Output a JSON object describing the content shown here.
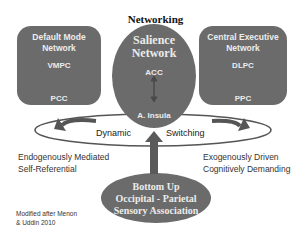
{
  "diagram": {
    "title": "Networking",
    "default_mode_network": {
      "title_line1": "Default Mode",
      "title_line2": "Network",
      "nodes": [
        "VMPC",
        "PCC"
      ]
    },
    "salience_network": {
      "title_line1": "Salience",
      "title_line2": "Network",
      "nodes": [
        "ACC",
        "A. Insula"
      ]
    },
    "central_executive_network": {
      "title_line1": "Central Executive",
      "title_line2": "Network",
      "nodes": [
        "DLPC",
        "PPC"
      ]
    },
    "switching_ring": {
      "left_label": "Dynamic",
      "right_label": "Switching"
    },
    "left_caption": {
      "line1": "Endogenously Mediated",
      "line2": "Self-Referential"
    },
    "right_caption": {
      "line1": "Exogenously Driven",
      "line2": "Cognitively Demanding"
    },
    "bottom_up": {
      "line1": "Bottom Up",
      "line2": "Occipital - Parietal",
      "line3": "Sensory Association"
    },
    "citation": {
      "line1": "Modified after Menon",
      "line2": "& Uddin 2010"
    },
    "colors": {
      "box_fill": "#6b6b6b",
      "box_text": "#ececec",
      "arrow": "#5a5a5a",
      "background": "#ffffff"
    }
  }
}
